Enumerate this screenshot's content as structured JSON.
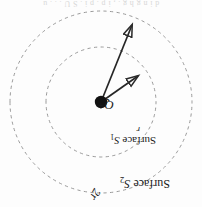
{
  "figure": {
    "name": "gaussian-surfaces-point-charge",
    "orientation": "rotated-180",
    "background_color": "#fdfdfd",
    "stroke_color": "#3a3a3a",
    "dash_color": "#8e8e8e",
    "charge_color": "#111111",
    "caption_bleed_text": "d i n g   h g . , i p . p   i .     S U . . .     u"
  },
  "geometry": {
    "center_x": 101,
    "center_y": 105,
    "inner_radius": 55,
    "outer_radius": 91,
    "r_arrow": {
      "x1": 101,
      "y1": 105,
      "x2": 62,
      "y2": 133
    },
    "two_r_arrow": {
      "x1": 101,
      "y1": 105,
      "x2": 68,
      "y2": 186
    }
  },
  "labels": {
    "charge": "+Q",
    "charge_symbol": "Q",
    "charge_sign": "+",
    "radius_inner": "r",
    "radius_outer": "2r",
    "surface_inner_prefix": "Surface ",
    "surface_inner_symbol": "S",
    "surface_inner_index": "1",
    "surface_outer_prefix": "Surface ",
    "surface_outer_symbol": "S",
    "surface_outer_index": "2"
  }
}
